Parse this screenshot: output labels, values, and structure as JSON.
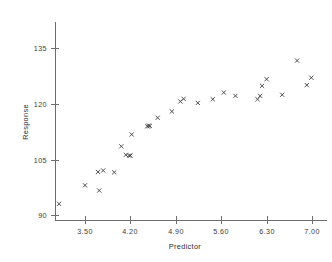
{
  "chart_data": {
    "type": "scatter",
    "title": "",
    "xlabel": "Predictor",
    "ylabel": "Response",
    "xlim": [
      3.05,
      7.25
    ],
    "ylim": [
      88.0,
      138.5
    ],
    "grid": false,
    "legend": null,
    "marker": "x",
    "marker_color": "#3c3c3c",
    "xticks": [
      3.5,
      4.2,
      4.9,
      5.6,
      6.3,
      7.0
    ],
    "xtick_labels": [
      "3.50",
      "4.20",
      "4.90",
      "5.60",
      "6.30",
      "7.00"
    ],
    "yticks": [
      90,
      105,
      120,
      135
    ],
    "ytick_labels": [
      "90",
      "105",
      "120",
      "135"
    ],
    "n_points": 30,
    "points": [
      {
        "x": 3.1,
        "y": 93.0
      },
      {
        "x": 3.5,
        "y": 98.0
      },
      {
        "x": 3.7,
        "y": 101.6
      },
      {
        "x": 3.72,
        "y": 96.6
      },
      {
        "x": 3.78,
        "y": 102.0
      },
      {
        "x": 3.95,
        "y": 101.5
      },
      {
        "x": 4.06,
        "y": 108.5
      },
      {
        "x": 4.13,
        "y": 106.2
      },
      {
        "x": 4.2,
        "y": 106.0
      },
      {
        "x": 4.22,
        "y": 111.7
      },
      {
        "x": 4.46,
        "y": 113.9
      },
      {
        "x": 4.5,
        "y": 114.0
      },
      {
        "x": 4.62,
        "y": 116.2
      },
      {
        "x": 4.84,
        "y": 117.9
      },
      {
        "x": 4.97,
        "y": 120.6
      },
      {
        "x": 5.02,
        "y": 121.3
      },
      {
        "x": 5.24,
        "y": 120.2
      },
      {
        "x": 5.47,
        "y": 121.2
      },
      {
        "x": 5.64,
        "y": 123.0
      },
      {
        "x": 5.82,
        "y": 122.1
      },
      {
        "x": 6.16,
        "y": 121.2
      },
      {
        "x": 6.2,
        "y": 122.1
      },
      {
        "x": 6.23,
        "y": 124.8
      },
      {
        "x": 6.3,
        "y": 126.6
      },
      {
        "x": 6.54,
        "y": 122.4
      },
      {
        "x": 6.77,
        "y": 131.6
      },
      {
        "x": 6.92,
        "y": 125.0
      },
      {
        "x": 6.99,
        "y": 127.0
      },
      {
        "x": 4.18,
        "y": 106.0
      },
      {
        "x": 4.48,
        "y": 114.0
      }
    ]
  },
  "axes": {
    "y_title": "Response",
    "x_title": "Predictor"
  }
}
